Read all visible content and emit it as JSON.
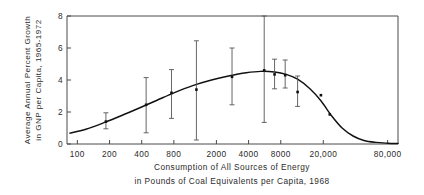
{
  "chart_data": {
    "type": "scatter",
    "title": "",
    "xlabel": "Consumption of All Sources of Energy in Pounds of Coal Equivalents per Capita, 1968",
    "xlabel_line1": "Consumption of All Sources of Energy",
    "xlabel_line2": "in Pounds of Coal Equivalents per Capita, 1968",
    "ylabel": "Average Annual Percent Growth in GNP per Capita, 1965-1972",
    "ylabel_line1": "Average Annual Percent Growth",
    "ylabel_line2": "in GNP per Capita, 1965-1972",
    "xscale": "log",
    "yscale": "linear",
    "xlim": [
      80,
      100000
    ],
    "ylim": [
      0,
      8
    ],
    "grid": false,
    "legend": null,
    "xticks": [
      100,
      200,
      400,
      800,
      2000,
      4000,
      8000,
      20000,
      80000
    ],
    "xtick_labels": [
      "100",
      "200",
      "400",
      "800",
      "2000",
      "4000",
      "8000",
      "20,000",
      "80,000"
    ],
    "yticks": [
      0,
      2,
      4,
      6,
      8
    ],
    "ytick_labels": [
      "0",
      "2",
      "4",
      "6",
      "8"
    ],
    "marker_style": "filled-square",
    "points": [
      {
        "x": 185,
        "y": 1.4,
        "y_low": 0.95,
        "y_high": 1.95
      },
      {
        "x": 440,
        "y": 2.45,
        "y_low": 0.7,
        "y_high": 4.15
      },
      {
        "x": 760,
        "y": 3.2,
        "y_low": 1.6,
        "y_high": 4.65
      },
      {
        "x": 1300,
        "y": 3.4,
        "y_low": 0.25,
        "y_high": 6.45
      },
      {
        "x": 2800,
        "y": 4.2,
        "y_low": 2.45,
        "y_high": 6.0
      },
      {
        "x": 5600,
        "y": 4.6,
        "y_low": 1.35,
        "y_high": 8.0
      },
      {
        "x": 7000,
        "y": 4.35,
        "y_low": 3.45,
        "y_high": 5.3
      },
      {
        "x": 8800,
        "y": 4.3,
        "y_low": 3.5,
        "y_high": 5.25
      },
      {
        "x": 11500,
        "y": 3.25,
        "y_low": 2.35,
        "y_high": 4.25
      },
      {
        "x": 19000,
        "y": 3.05,
        "y_low": null,
        "y_high": null
      },
      {
        "x": 23000,
        "y": 1.85,
        "y_low": null,
        "y_high": null
      }
    ],
    "fitted_curve": [
      {
        "x": 85,
        "y": 0.68
      },
      {
        "x": 120,
        "y": 0.92
      },
      {
        "x": 180,
        "y": 1.35
      },
      {
        "x": 260,
        "y": 1.78
      },
      {
        "x": 380,
        "y": 2.25
      },
      {
        "x": 550,
        "y": 2.72
      },
      {
        "x": 800,
        "y": 3.2
      },
      {
        "x": 1200,
        "y": 3.65
      },
      {
        "x": 1800,
        "y": 4.0
      },
      {
        "x": 2600,
        "y": 4.25
      },
      {
        "x": 3800,
        "y": 4.45
      },
      {
        "x": 5200,
        "y": 4.54
      },
      {
        "x": 7000,
        "y": 4.5
      },
      {
        "x": 9000,
        "y": 4.35
      },
      {
        "x": 11500,
        "y": 4.05
      },
      {
        "x": 15000,
        "y": 3.45
      },
      {
        "x": 19000,
        "y": 2.7
      },
      {
        "x": 24000,
        "y": 1.75
      },
      {
        "x": 30000,
        "y": 1.0
      },
      {
        "x": 38000,
        "y": 0.5
      },
      {
        "x": 48000,
        "y": 0.22
      },
      {
        "x": 62000,
        "y": 0.1
      },
      {
        "x": 80000,
        "y": 0.05
      },
      {
        "x": 100000,
        "y": 0.03
      }
    ]
  },
  "figure": {
    "frame_color": "#4a4a4a",
    "curve_color": "#111111",
    "marker_color": "#101010",
    "error_color": "#555555",
    "background": "#ffffff"
  }
}
